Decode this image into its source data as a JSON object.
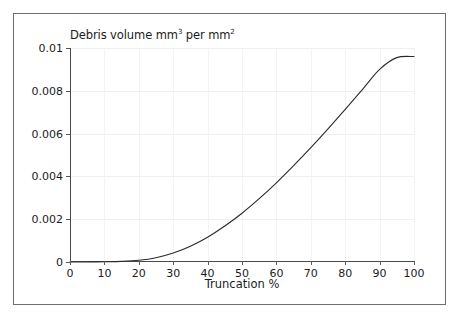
{
  "figure": {
    "background_color": "#ffffff",
    "frame_color": "#6e6e6e"
  },
  "chart_data": {
    "type": "line",
    "title": "Debris volume mm",
    "title_sup1": "3",
    "title_mid": " per mm",
    "title_sup2": "2",
    "title_full": "Debris volume mm3 per mm2",
    "xlabel": "Truncation %",
    "ylabel": "",
    "xlim": [
      0,
      100
    ],
    "ylim": [
      0,
      0.01
    ],
    "grid": true,
    "legend": "none",
    "line_color": "#2a2a2a",
    "xticks": [
      "0",
      "10",
      "20",
      "30",
      "40",
      "50",
      "60",
      "70",
      "80",
      "90",
      "100"
    ],
    "xtick_values": [
      0,
      10,
      20,
      30,
      40,
      50,
      60,
      70,
      80,
      90,
      100
    ],
    "yticks": [
      "0",
      "0.002",
      "0.004",
      "0.006",
      "0.008",
      "0.01"
    ],
    "ytick_values": [
      0,
      0.002,
      0.004,
      0.006,
      0.008,
      0.01
    ],
    "series": [
      {
        "name": "Debris volume",
        "x": [
          0,
          5,
          10,
          15,
          20,
          25,
          30,
          35,
          40,
          45,
          50,
          55,
          60,
          65,
          70,
          75,
          80,
          85,
          90,
          95,
          100
        ],
        "y": [
          0.0,
          0.0,
          1e-05,
          3e-05,
          8e-05,
          0.0002,
          0.00042,
          0.00074,
          0.00116,
          0.00168,
          0.00228,
          0.00296,
          0.0037,
          0.0045,
          0.00534,
          0.00622,
          0.00713,
          0.00806,
          0.009,
          0.00955,
          0.0096
        ]
      }
    ]
  }
}
